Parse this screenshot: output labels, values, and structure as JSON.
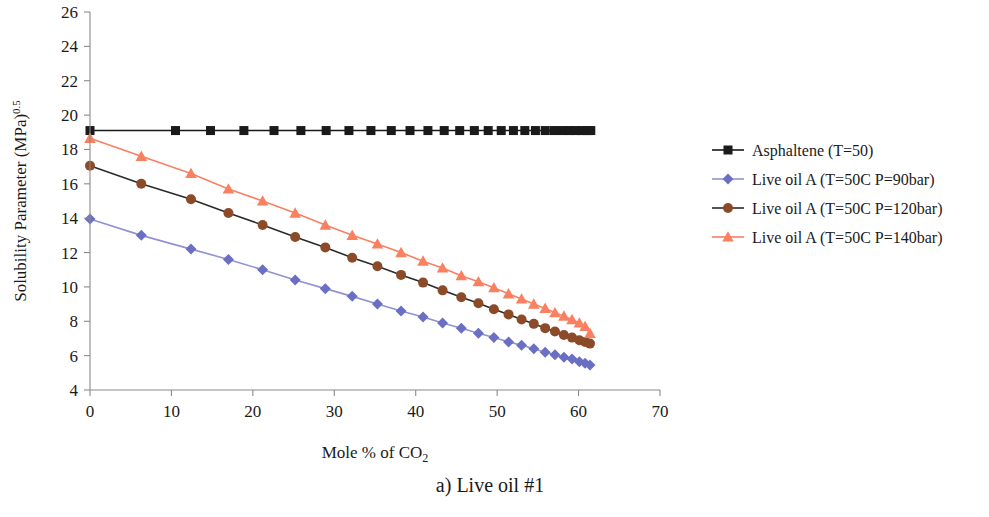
{
  "chart_data": {
    "type": "line",
    "title": "",
    "caption": "a) Live oil #1",
    "xlabel": "Mole % of  CO",
    "xlabel_sub": "2",
    "ylabel": "Solubility Parameter (MPa)",
    "ylabel_exp": "0.5",
    "xlim": [
      0,
      70
    ],
    "ylim": [
      4,
      26
    ],
    "xticks": [
      0,
      10,
      20,
      30,
      40,
      50,
      60,
      70
    ],
    "yticks": [
      4,
      6,
      8,
      10,
      12,
      14,
      16,
      18,
      20,
      22,
      24,
      26
    ],
    "grid": false,
    "legend_position": "right",
    "series": [
      {
        "name": "Asphaltene (T=50)",
        "color": "#1a1a1a",
        "line_color": "#1a1a1a",
        "marker": "square",
        "x": [
          0,
          10.5,
          14.8,
          18.9,
          22.6,
          25.9,
          29.0,
          31.8,
          34.5,
          37.0,
          39.3,
          41.5,
          43.5,
          45.4,
          47.2,
          48.9,
          50.5,
          52.0,
          53.4,
          54.7,
          55.9,
          57.0,
          58.0,
          58.9,
          59.7,
          60.4,
          61.0,
          61.5
        ],
        "y": [
          19.1,
          19.1,
          19.1,
          19.1,
          19.1,
          19.1,
          19.1,
          19.1,
          19.1,
          19.1,
          19.1,
          19.1,
          19.1,
          19.1,
          19.1,
          19.1,
          19.1,
          19.1,
          19.1,
          19.1,
          19.1,
          19.1,
          19.1,
          19.1,
          19.1,
          19.1,
          19.1,
          19.1
        ]
      },
      {
        "name": "Live  oil A (T=50C P=90bar)",
        "color": "#6b6fc4",
        "line_color": "#8f93d4",
        "marker": "diamond",
        "x": [
          0,
          6.3,
          12.4,
          17.0,
          21.2,
          25.2,
          28.9,
          32.2,
          35.3,
          38.2,
          40.9,
          43.3,
          45.6,
          47.7,
          49.6,
          51.4,
          53.0,
          54.5,
          55.9,
          57.1,
          58.2,
          59.2,
          60.1,
          60.8,
          61.4
        ],
        "y": [
          13.95,
          13.0,
          12.2,
          11.6,
          11.0,
          10.4,
          9.9,
          9.45,
          9.0,
          8.6,
          8.25,
          7.9,
          7.6,
          7.3,
          7.05,
          6.8,
          6.6,
          6.4,
          6.2,
          6.05,
          5.9,
          5.8,
          5.65,
          5.55,
          5.45
        ]
      },
      {
        "name": "Live  oil A (T=50C P=120bar)",
        "color": "#8b4a28",
        "line_color": "#2a2a2a",
        "marker": "circle",
        "x": [
          0,
          6.3,
          12.4,
          17.0,
          21.2,
          25.2,
          28.9,
          32.2,
          35.3,
          38.2,
          40.9,
          43.3,
          45.6,
          47.7,
          49.6,
          51.4,
          53.0,
          54.5,
          55.9,
          57.1,
          58.2,
          59.2,
          60.1,
          60.8,
          61.4
        ],
        "y": [
          17.05,
          16.0,
          15.1,
          14.3,
          13.6,
          12.9,
          12.3,
          11.7,
          11.2,
          10.7,
          10.25,
          9.8,
          9.4,
          9.05,
          8.7,
          8.4,
          8.1,
          7.85,
          7.6,
          7.4,
          7.2,
          7.05,
          6.9,
          6.8,
          6.7
        ]
      },
      {
        "name": "Live  oil A (T=50C P=140bar)",
        "color": "#f98060",
        "line_color": "#f98060",
        "marker": "triangle",
        "x": [
          0,
          6.3,
          12.4,
          17.0,
          21.2,
          25.2,
          28.9,
          32.2,
          35.3,
          38.2,
          40.9,
          43.3,
          45.6,
          47.7,
          49.6,
          51.4,
          53.0,
          54.5,
          55.9,
          57.1,
          58.2,
          59.2,
          60.1,
          60.8,
          61.4
        ],
        "y": [
          18.65,
          17.6,
          16.6,
          15.7,
          15.0,
          14.3,
          13.6,
          13.0,
          12.5,
          12.0,
          11.5,
          11.1,
          10.65,
          10.3,
          9.95,
          9.6,
          9.3,
          9.0,
          8.75,
          8.5,
          8.3,
          8.1,
          7.9,
          7.7,
          7.3
        ]
      }
    ]
  }
}
